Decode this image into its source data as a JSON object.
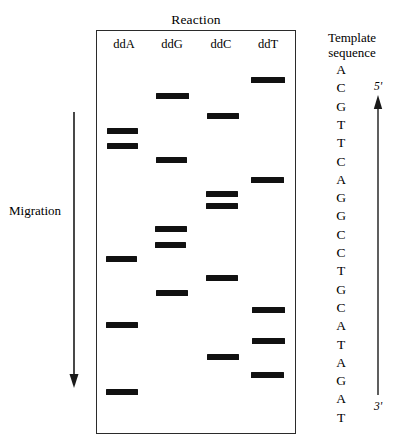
{
  "figure": {
    "type": "sanger-sequencing-gel-autoradiogram",
    "reaction_title": "Reaction",
    "migration_label": "Migration",
    "migration_direction": "down",
    "template_title_line1": "Template",
    "template_title_line2": "sequence",
    "polarity_top": "5'",
    "polarity_bottom": "3'",
    "band_color": "#111111",
    "box_color": "#2b2b2b",
    "background": "#ffffff"
  },
  "lanes": [
    {
      "label": "ddA",
      "center_x": 124,
      "index": 0
    },
    {
      "label": "ddG",
      "center_x": 172,
      "index": 1
    },
    {
      "label": "ddC",
      "center_x": 221,
      "index": 2
    },
    {
      "label": "ddT",
      "center_x": 268,
      "index": 3
    }
  ],
  "bands": [
    {
      "lane": "ddT",
      "y": 77,
      "x": 251,
      "width": 34
    },
    {
      "lane": "ddG",
      "y": 93,
      "x": 156,
      "width": 33
    },
    {
      "lane": "ddC",
      "y": 113,
      "x": 207,
      "width": 32
    },
    {
      "lane": "ddA",
      "y": 128,
      "x": 107,
      "width": 31
    },
    {
      "lane": "ddA",
      "y": 143,
      "x": 107,
      "width": 31
    },
    {
      "lane": "ddG",
      "y": 157,
      "x": 156,
      "width": 31
    },
    {
      "lane": "ddT",
      "y": 177,
      "x": 251,
      "width": 33
    },
    {
      "lane": "ddC",
      "y": 191,
      "x": 206,
      "width": 32
    },
    {
      "lane": "ddC",
      "y": 203,
      "x": 206,
      "width": 32
    },
    {
      "lane": "ddG",
      "y": 226,
      "x": 155,
      "width": 32
    },
    {
      "lane": "ddG",
      "y": 242,
      "x": 155,
      "width": 31
    },
    {
      "lane": "ddA",
      "y": 256,
      "x": 106,
      "width": 31
    },
    {
      "lane": "ddC",
      "y": 275,
      "x": 206,
      "width": 32
    },
    {
      "lane": "ddG",
      "y": 290,
      "x": 156,
      "width": 32
    },
    {
      "lane": "ddT",
      "y": 307,
      "x": 252,
      "width": 33
    },
    {
      "lane": "ddA",
      "y": 322,
      "x": 106,
      "width": 32
    },
    {
      "lane": "ddT",
      "y": 338,
      "x": 252,
      "width": 33
    },
    {
      "lane": "ddC",
      "y": 354,
      "x": 207,
      "width": 32
    },
    {
      "lane": "ddT",
      "y": 372,
      "x": 251,
      "width": 33
    },
    {
      "lane": "ddA",
      "y": 389,
      "x": 106,
      "width": 32
    }
  ],
  "template_sequence": {
    "bases": [
      "A",
      "C",
      "G",
      "T",
      "T",
      "C",
      "A",
      "G",
      "G",
      "C",
      "C",
      "T",
      "G",
      "C",
      "A",
      "T",
      "A",
      "G",
      "A",
      "T"
    ],
    "positions_y": [
      70,
      90,
      110,
      130,
      150,
      170,
      192,
      212,
      233,
      253,
      273,
      292,
      311,
      330,
      350,
      370,
      389,
      390,
      409,
      418
    ],
    "read_direction": "5' (top) to 3' (bottom)"
  },
  "chart_data": {
    "type": "gel-lanes",
    "title": "Reaction",
    "categories": [
      "ddA",
      "ddG",
      "ddC",
      "ddT"
    ],
    "series": [
      {
        "name": "ddA",
        "band_positions_y": [
          128,
          143,
          256,
          322,
          389
        ]
      },
      {
        "name": "ddG",
        "band_positions_y": [
          93,
          157,
          226,
          242,
          290
        ]
      },
      {
        "name": "ddC",
        "band_positions_y": [
          113,
          191,
          203,
          275,
          354
        ]
      },
      {
        "name": "ddT",
        "band_positions_y": [
          77,
          177,
          307,
          338,
          372
        ]
      }
    ],
    "xlabel": "Reaction",
    "ylabel": "Migration",
    "axis_direction": "larger fragments at top, smaller fragments migrate downward",
    "annotations": [
      "Migration",
      "Template sequence",
      "5'",
      "3'"
    ]
  }
}
